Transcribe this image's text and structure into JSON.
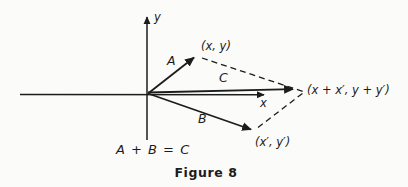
{
  "figure": {
    "paper": "#fbfbf9",
    "ink": "#1c1c1c",
    "axes": {
      "x_label": "x",
      "y_label": "y"
    },
    "vectors": [
      {
        "id": "A",
        "label": "A",
        "tip_label": "(x, y)"
      },
      {
        "id": "B",
        "label": "B",
        "tip_label": "(x′, y′)"
      },
      {
        "id": "C",
        "label": "C",
        "tip_label": "(x + x′, y + y′)"
      }
    ],
    "equation": "A + B = C",
    "caption": "Figure 8"
  }
}
